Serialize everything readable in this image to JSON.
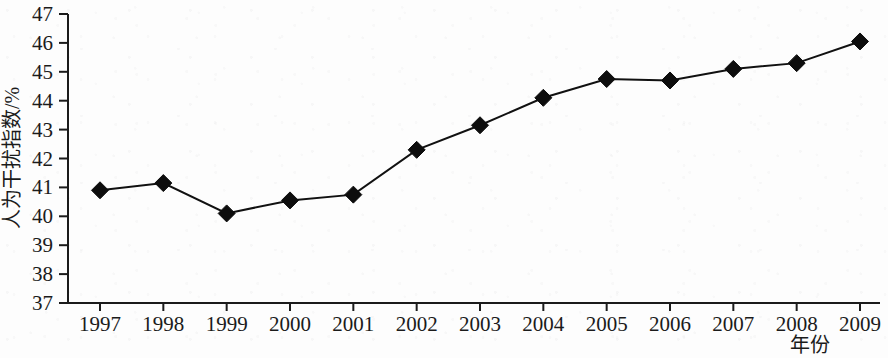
{
  "chart_data": {
    "type": "line",
    "title": "",
    "xlabel": "年份",
    "ylabel": "人为干扰指数/%",
    "categories": [
      "1997",
      "1998",
      "1999",
      "2000",
      "2001",
      "2002",
      "2003",
      "2004",
      "2005",
      "2006",
      "2007",
      "2008",
      "2009"
    ],
    "values": [
      40.9,
      41.15,
      40.1,
      40.55,
      40.75,
      42.3,
      43.15,
      44.1,
      44.75,
      44.7,
      45.1,
      45.3,
      46.05
    ],
    "series": [
      {
        "name": "人为干扰指数",
        "values": [
          40.9,
          41.15,
          40.1,
          40.55,
          40.75,
          42.3,
          43.15,
          44.1,
          44.75,
          44.7,
          45.1,
          45.3,
          46.05
        ]
      }
    ],
    "ylim": [
      37,
      47
    ],
    "ytick_labels": [
      "37",
      "38",
      "39",
      "40",
      "41",
      "42",
      "43",
      "44",
      "45",
      "46",
      "47"
    ],
    "ytick_values": [
      37,
      38,
      39,
      40,
      41,
      42,
      43,
      44,
      45,
      46,
      47
    ],
    "xtick_labels": [
      "1997",
      "1998",
      "1999",
      "2000",
      "2001",
      "2002",
      "2003",
      "2004",
      "2005",
      "2006",
      "2007",
      "2008",
      "2009"
    ],
    "grid": false,
    "legend": false,
    "legend_position": "none",
    "marker": "diamond",
    "line_color": "#111111",
    "marker_color": "#0d0d0d",
    "background_color": "#fdfdfd"
  }
}
